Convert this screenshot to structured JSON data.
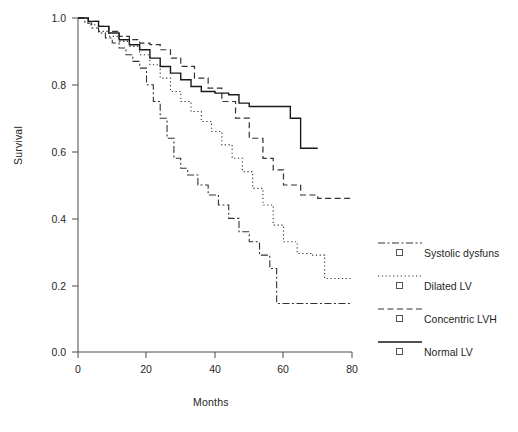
{
  "chart_data": {
    "type": "line",
    "title": "",
    "subtitle": "",
    "xlabel": "Months",
    "ylabel": "Survival",
    "xlim": [
      0,
      80
    ],
    "ylim": [
      0.0,
      1.0
    ],
    "xticks": [
      0,
      20,
      40,
      60,
      80
    ],
    "xticklabels": [
      "0",
      "20",
      "40",
      "60",
      "80"
    ],
    "yticks": [
      0.0,
      0.2,
      0.4,
      0.6,
      0.8,
      1.0
    ],
    "yticklabels": [
      "0.0",
      "0.2",
      "0.4",
      "0.6",
      "0.8",
      "1.0"
    ],
    "grid": false,
    "legend_position": "right",
    "curve_style": "step-post (Kaplan-Meier survival)",
    "series": [
      {
        "name": "Systolic dysfuns",
        "linestyle": "dash-dot",
        "color": "#333333",
        "x": [
          0,
          2,
          4,
          6,
          8,
          10,
          12,
          14,
          16,
          18,
          20,
          22,
          24,
          26,
          28,
          30,
          32,
          35,
          38,
          41,
          44,
          47,
          50,
          53,
          56,
          58,
          80
        ],
        "y": [
          1.0,
          0.985,
          0.97,
          0.955,
          0.94,
          0.925,
          0.91,
          0.89,
          0.87,
          0.85,
          0.8,
          0.75,
          0.7,
          0.64,
          0.58,
          0.55,
          0.53,
          0.5,
          0.47,
          0.44,
          0.4,
          0.36,
          0.33,
          0.29,
          0.25,
          0.145,
          0.145
        ]
      },
      {
        "name": "Dilated LV",
        "linestyle": "dotted",
        "color": "#333333",
        "x": [
          0,
          3,
          6,
          9,
          12,
          15,
          18,
          21,
          24,
          27,
          30,
          33,
          36,
          39,
          42,
          45,
          48,
          51,
          54,
          57,
          60,
          64,
          68,
          72,
          76,
          80
        ],
        "y": [
          1.0,
          0.98,
          0.96,
          0.945,
          0.93,
          0.915,
          0.89,
          0.86,
          0.82,
          0.78,
          0.75,
          0.72,
          0.69,
          0.66,
          0.62,
          0.58,
          0.54,
          0.49,
          0.44,
          0.38,
          0.33,
          0.295,
          0.29,
          0.22,
          0.22,
          0.22
        ]
      },
      {
        "name": "Concentric LVH",
        "linestyle": "dashed",
        "color": "#333333",
        "x": [
          0,
          3,
          6,
          9,
          12,
          15,
          18,
          21,
          24,
          27,
          30,
          34,
          38,
          42,
          46,
          50,
          54,
          57,
          60,
          65,
          70,
          75,
          80
        ],
        "y": [
          1.0,
          0.99,
          0.975,
          0.96,
          0.945,
          0.935,
          0.925,
          0.92,
          0.905,
          0.88,
          0.855,
          0.82,
          0.79,
          0.75,
          0.7,
          0.64,
          0.58,
          0.545,
          0.5,
          0.47,
          0.46,
          0.46,
          0.46
        ]
      },
      {
        "name": "Normal LV",
        "linestyle": "solid",
        "color": "#1a1a1a",
        "x": [
          0,
          3,
          6,
          9,
          12,
          15,
          18,
          21,
          24,
          27,
          30,
          33,
          36,
          40,
          44,
          47,
          50,
          54,
          58,
          62,
          65,
          70
        ],
        "y": [
          1.0,
          0.99,
          0.975,
          0.955,
          0.935,
          0.92,
          0.905,
          0.88,
          0.855,
          0.835,
          0.815,
          0.795,
          0.78,
          0.775,
          0.77,
          0.745,
          0.735,
          0.735,
          0.735,
          0.7,
          0.61,
          0.61
        ]
      }
    ]
  },
  "legend": {
    "entries": [
      {
        "label": "Systolic dysfuns",
        "marker": "open-square",
        "linestyle": "dash-dot"
      },
      {
        "label": "Dilated LV",
        "marker": "open-square",
        "linestyle": "dotted"
      },
      {
        "label": "Concentric LVH",
        "marker": "open-square",
        "linestyle": "dashed"
      },
      {
        "label": "Normal LV",
        "marker": "open-square",
        "linestyle": "solid"
      }
    ]
  }
}
